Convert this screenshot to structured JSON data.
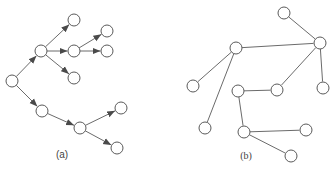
{
  "figure": {
    "panels": [
      {
        "id": "a",
        "label": "(a)",
        "type": "directed-tree",
        "label_pos": [
          62,
          158
        ],
        "node_radius": 6,
        "nodes": [
          {
            "id": "root",
            "x": 12,
            "y": 81
          },
          {
            "id": "a",
            "x": 41,
            "y": 51
          },
          {
            "id": "a1",
            "x": 74,
            "y": 20
          },
          {
            "id": "a2",
            "x": 74,
            "y": 51
          },
          {
            "id": "a2a",
            "x": 107,
            "y": 31
          },
          {
            "id": "a2b",
            "x": 107,
            "y": 51
          },
          {
            "id": "a3",
            "x": 74,
            "y": 78
          },
          {
            "id": "b",
            "x": 42,
            "y": 111
          },
          {
            "id": "b1",
            "x": 80,
            "y": 128
          },
          {
            "id": "b1a",
            "x": 121,
            "y": 108
          },
          {
            "id": "b1b",
            "x": 117,
            "y": 148
          }
        ],
        "edges": [
          [
            "root",
            "a"
          ],
          [
            "a",
            "a1"
          ],
          [
            "a",
            "a2"
          ],
          [
            "a",
            "a3"
          ],
          [
            "a2",
            "a2a"
          ],
          [
            "a2",
            "a2b"
          ],
          [
            "root",
            "b"
          ],
          [
            "b",
            "b1"
          ],
          [
            "b1",
            "b1a"
          ],
          [
            "b1",
            "b1b"
          ]
        ]
      },
      {
        "id": "b",
        "label": "(b)",
        "type": "undirected-tree",
        "label_pos": [
          246,
          159
        ],
        "node_radius": 6,
        "nodes": [
          {
            "id": "top",
            "x": 284,
            "y": 13
          },
          {
            "id": "hub",
            "x": 320,
            "y": 43
          },
          {
            "id": "left",
            "x": 236,
            "y": 48
          },
          {
            "id": "leftleaf",
            "x": 193,
            "y": 86
          },
          {
            "id": "leftbottom",
            "x": 205,
            "y": 128
          },
          {
            "id": "mid",
            "x": 277,
            "y": 90
          },
          {
            "id": "hubleaf",
            "x": 323,
            "y": 88
          },
          {
            "id": "m",
            "x": 238,
            "y": 91
          },
          {
            "id": "mb",
            "x": 244,
            "y": 132
          },
          {
            "id": "mr",
            "x": 306,
            "y": 130
          },
          {
            "id": "mbr",
            "x": 291,
            "y": 156
          }
        ],
        "edges": [
          [
            "top",
            "hub"
          ],
          [
            "left",
            "hub"
          ],
          [
            "hub",
            "mid"
          ],
          [
            "hub",
            "hubleaf"
          ],
          [
            "left",
            "leftleaf"
          ],
          [
            "left",
            "leftbottom"
          ],
          [
            "m",
            "mid"
          ],
          [
            "m",
            "mb"
          ],
          [
            "mb",
            "mr"
          ],
          [
            "mb",
            "mbr"
          ]
        ]
      }
    ]
  },
  "colors": {
    "edge": "#6b6b6b",
    "node_stroke": "#5a5a5a",
    "node_fill": "#ffffff",
    "arrowhead": "#4a4a4a"
  }
}
